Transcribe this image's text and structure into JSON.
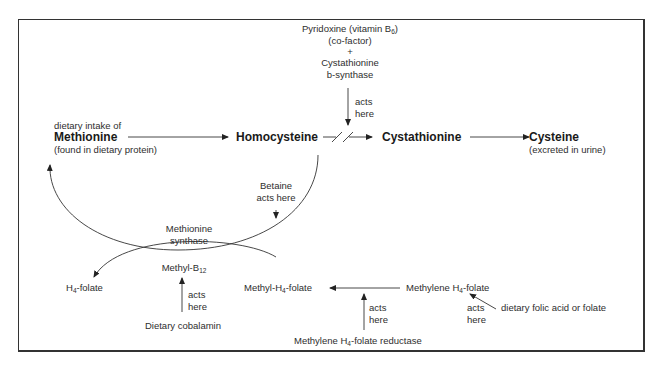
{
  "diagram": {
    "nodes": {
      "methionine": {
        "pre": "dietary intake of",
        "label": "Methionine",
        "note": "(found in dietary protein)"
      },
      "homocysteine": {
        "label": "Homocysteine"
      },
      "cystathionine": {
        "label": "Cystathionine"
      },
      "cysteine": {
        "label": "Cysteine",
        "note": "(excreted in urine)"
      },
      "h4_folate": {
        "label": "H",
        "sub": "4",
        "suffix": "-folate"
      },
      "methyl_b12": {
        "label": "Methyl-B",
        "sub": "12"
      },
      "methyl_h4_folate": {
        "label": "Methyl-H",
        "sub": "4",
        "suffix": "-folate"
      },
      "methylene_h4_folate": {
        "label": "Methylene H",
        "sub": "4",
        "suffix": "-folate"
      }
    },
    "factors": {
      "pyridoxine": {
        "line1": "Pyridoxine (vitamin B",
        "sub": "6",
        "line1_end": ")",
        "line2": "(co-factor)",
        "plus": "+",
        "line3": "Cystathionine",
        "line4": "b-synthase",
        "acts1": "acts",
        "acts2": "here"
      },
      "betaine": {
        "line1": "Betaine",
        "line2": "acts here"
      },
      "methionine_synthase": {
        "line1": "Methionine",
        "line2": "synthase"
      },
      "cobalamin": {
        "label": "Dietary cobalamin",
        "acts1": "acts",
        "acts2": "here"
      },
      "reductase": {
        "label": "Methylene H",
        "sub": "4",
        "suffix": "-folate reductase",
        "acts1": "acts",
        "acts2": "here"
      },
      "folic_acid": {
        "label": "dietary folic acid or folate",
        "acts1": "acts",
        "acts2": "here"
      }
    }
  }
}
